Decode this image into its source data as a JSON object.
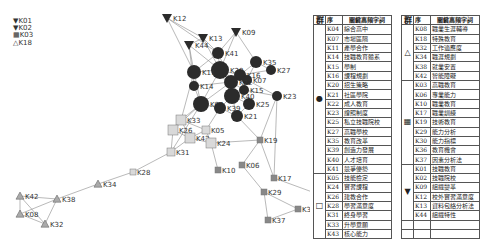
{
  "legend": [
    {
      "symbol": "▼",
      "code": "K01"
    },
    {
      "symbol": "▼",
      "code": "K02"
    },
    {
      "symbol": "▦",
      "code": "K03"
    },
    {
      "symbol": "△",
      "code": "K18"
    }
  ],
  "table": {
    "headers": {
      "group": "群",
      "code": "序",
      "keyword": "關鍵高頻字詞"
    },
    "left": {
      "groups": [
        {
          "symbol": "●",
          "rows": [
            {
              "code": "K04",
              "keyword": "綜合高中"
            },
            {
              "code": "K07",
              "keyword": "市場區隔"
            },
            {
              "code": "K11",
              "keyword": "產學合作"
            },
            {
              "code": "K14",
              "keyword": "技職教育體系"
            },
            {
              "code": "K15",
              "keyword": "學制"
            },
            {
              "code": "K16",
              "keyword": "課程規劃"
            },
            {
              "code": "K20",
              "keyword": "招生策略"
            },
            {
              "code": "K21",
              "keyword": "社區學院"
            },
            {
              "code": "K22",
              "keyword": "成人教育"
            },
            {
              "code": "K23",
              "keyword": "證照制度"
            },
            {
              "code": "K25",
              "keyword": "私立技職院校"
            },
            {
              "code": "K27",
              "keyword": "高職學校"
            },
            {
              "code": "K35",
              "keyword": "教育改革"
            },
            {
              "code": "K39",
              "keyword": "創造力發展"
            },
            {
              "code": "K40",
              "keyword": "人才培育"
            },
            {
              "code": "K41",
              "keyword": "競爭優勢"
            }
          ]
        },
        {
          "symbol": "□",
          "rows": [
            {
              "code": "K05",
              "keyword": "技能檢定"
            },
            {
              "code": "K24",
              "keyword": "實習課程"
            },
            {
              "code": "K26",
              "keyword": "建教合作"
            },
            {
              "code": "K28",
              "keyword": "學習滿意度"
            },
            {
              "code": "K31",
              "keyword": "終身學習"
            },
            {
              "code": "K33",
              "keyword": "升學意願"
            },
            {
              "code": "K43",
              "keyword": "核心能力"
            }
          ]
        }
      ]
    },
    "right": {
      "groups": [
        {
          "symbol": "△",
          "rows": [
            {
              "code": "K08",
              "keyword": "職業生涯輔導"
            },
            {
              "code": "K18",
              "keyword": "特殊教育"
            },
            {
              "code": "K32",
              "keyword": "工作適應度"
            },
            {
              "code": "K34",
              "keyword": "職涯規劃"
            },
            {
              "code": "K38",
              "keyword": "就業安置"
            },
            {
              "code": "K42",
              "keyword": "智能障礙"
            }
          ]
        },
        {
          "symbol": "▦",
          "rows": [
            {
              "code": "K03",
              "keyword": "高職教育"
            },
            {
              "code": "K06",
              "keyword": "專業能力"
            },
            {
              "code": "K10",
              "keyword": "職業教育"
            },
            {
              "code": "K17",
              "keyword": "職業訓練"
            },
            {
              "code": "K19",
              "keyword": "技術教育"
            },
            {
              "code": "K29",
              "keyword": "能力分析"
            },
            {
              "code": "K30",
              "keyword": "能力指標"
            },
            {
              "code": "K36",
              "keyword": "教育機會"
            },
            {
              "code": "K37",
              "keyword": "因素分析法"
            }
          ]
        },
        {
          "symbol": "▼",
          "rows": [
            {
              "code": "K01",
              "keyword": "技職教育"
            },
            {
              "code": "K02",
              "keyword": "技職院校"
            },
            {
              "code": "K09",
              "keyword": "組織變革"
            },
            {
              "code": "K12",
              "keyword": "校外實習滿意度"
            },
            {
              "code": "K13",
              "keyword": "資料包絡分析法"
            },
            {
              "code": "K44",
              "keyword": "組織特性"
            }
          ]
        }
      ]
    }
  },
  "network": {
    "nodes": [
      {
        "id": "K12",
        "shape": "tri-down",
        "x": 167,
        "y": 18,
        "r": 5
      },
      {
        "id": "K13",
        "shape": "tri-down",
        "x": 203,
        "y": 38,
        "r": 5
      },
      {
        "id": "K09",
        "shape": "tri-down",
        "x": 236,
        "y": 32,
        "r": 5
      },
      {
        "id": "K44",
        "shape": "tri-down",
        "x": 189,
        "y": 45,
        "r": 5
      },
      {
        "id": "K41",
        "shape": "circle",
        "x": 218,
        "y": 53,
        "r": 6
      },
      {
        "id": "K20",
        "shape": "circle",
        "x": 220,
        "y": 70,
        "r": 9
      },
      {
        "id": "K35",
        "shape": "circle",
        "x": 256,
        "y": 62,
        "r": 6
      },
      {
        "id": "K27",
        "shape": "circle",
        "x": 271,
        "y": 70,
        "r": 5
      },
      {
        "id": "K11",
        "shape": "circle",
        "x": 194,
        "y": 72,
        "r": 7
      },
      {
        "id": "K16",
        "shape": "circle",
        "x": 240,
        "y": 75,
        "r": 6
      },
      {
        "id": "K07",
        "shape": "circle",
        "x": 247,
        "y": 80,
        "r": 5
      },
      {
        "id": "K22",
        "shape": "circle",
        "x": 231,
        "y": 82,
        "r": 7
      },
      {
        "id": "K14",
        "shape": "circle",
        "x": 194,
        "y": 86,
        "r": 5
      },
      {
        "id": "K40",
        "shape": "circle",
        "x": 232,
        "y": 96,
        "r": 8
      },
      {
        "id": "K15",
        "shape": "circle",
        "x": 244,
        "y": 90,
        "r": 5
      },
      {
        "id": "K23",
        "shape": "circle",
        "x": 277,
        "y": 96,
        "r": 5
      },
      {
        "id": "K04",
        "shape": "circle",
        "x": 201,
        "y": 104,
        "r": 8
      },
      {
        "id": "K25",
        "shape": "circle",
        "x": 249,
        "y": 104,
        "r": 6
      },
      {
        "id": "K39",
        "shape": "circle",
        "x": 220,
        "y": 108,
        "r": 6
      },
      {
        "id": "K21",
        "shape": "circle",
        "x": 237,
        "y": 116,
        "r": 6
      },
      {
        "id": "K33",
        "shape": "square",
        "x": 181,
        "y": 120,
        "r": 5
      },
      {
        "id": "K26",
        "shape": "square",
        "x": 173,
        "y": 130,
        "r": 5
      },
      {
        "id": "K05",
        "shape": "square",
        "x": 206,
        "y": 130,
        "r": 4
      },
      {
        "id": "K43",
        "shape": "square",
        "x": 190,
        "y": 138,
        "r": 5
      },
      {
        "id": "K24",
        "shape": "square",
        "x": 211,
        "y": 143,
        "r": 5
      },
      {
        "id": "K31",
        "shape": "square",
        "x": 171,
        "y": 152,
        "r": 4
      },
      {
        "id": "K28",
        "shape": "square",
        "x": 133,
        "y": 172,
        "r": 3
      },
      {
        "id": "K19",
        "shape": "grid",
        "x": 260,
        "y": 140,
        "r": 3
      },
      {
        "id": "K06",
        "shape": "grid",
        "x": 242,
        "y": 165,
        "r": 3
      },
      {
        "id": "K10",
        "shape": "grid",
        "x": 218,
        "y": 170,
        "r": 3
      },
      {
        "id": "K17",
        "shape": "grid",
        "x": 274,
        "y": 178,
        "r": 3
      },
      {
        "id": "K29",
        "shape": "grid",
        "x": 264,
        "y": 192,
        "r": 3
      },
      {
        "id": "K36",
        "shape": "grid",
        "x": 315,
        "y": 193,
        "r": 3
      },
      {
        "id": "K30",
        "shape": "grid",
        "x": 298,
        "y": 209,
        "r": 3
      },
      {
        "id": "K37",
        "shape": "grid",
        "x": 268,
        "y": 220,
        "r": 3
      },
      {
        "id": "K34",
        "shape": "tri-up",
        "x": 98,
        "y": 184,
        "r": 4
      },
      {
        "id": "K42",
        "shape": "tri-up",
        "x": 20,
        "y": 196,
        "r": 4
      },
      {
        "id": "K38",
        "shape": "tri-up",
        "x": 57,
        "y": 199,
        "r": 4
      },
      {
        "id": "K08",
        "shape": "tri-up",
        "x": 20,
        "y": 214,
        "r": 4
      },
      {
        "id": "K32",
        "shape": "tri-up",
        "x": 45,
        "y": 224,
        "r": 4
      }
    ],
    "edges": [
      [
        "K12",
        "K13"
      ],
      [
        "K12",
        "K41"
      ],
      [
        "K12",
        "K11"
      ],
      [
        "K13",
        "K41"
      ],
      [
        "K13",
        "K20"
      ],
      [
        "K13",
        "K44"
      ],
      [
        "K09",
        "K41"
      ],
      [
        "K09",
        "K35"
      ],
      [
        "K09",
        "K20"
      ],
      [
        "K44",
        "K11"
      ],
      [
        "K44",
        "K20"
      ],
      [
        "K44",
        "K14"
      ],
      [
        "K41",
        "K20"
      ],
      [
        "K41",
        "K11"
      ],
      [
        "K41",
        "K22"
      ],
      [
        "K20",
        "K16"
      ],
      [
        "K20",
        "K22"
      ],
      [
        "K20",
        "K11"
      ],
      [
        "K20",
        "K40"
      ],
      [
        "K20",
        "K04"
      ],
      [
        "K35",
        "K16"
      ],
      [
        "K35",
        "K27"
      ],
      [
        "K35",
        "K07"
      ],
      [
        "K16",
        "K27"
      ],
      [
        "K16",
        "K07"
      ],
      [
        "K22",
        "K40"
      ],
      [
        "K22",
        "K14"
      ],
      [
        "K22",
        "K04"
      ],
      [
        "K22",
        "K15"
      ],
      [
        "K11",
        "K14"
      ],
      [
        "K11",
        "K04"
      ],
      [
        "K14",
        "K04"
      ],
      [
        "K40",
        "K39"
      ],
      [
        "K40",
        "K25"
      ],
      [
        "K40",
        "K21"
      ],
      [
        "K40",
        "K15"
      ],
      [
        "K15",
        "K23"
      ],
      [
        "K07",
        "K23"
      ],
      [
        "K04",
        "K39"
      ],
      [
        "K04",
        "K33"
      ],
      [
        "K04",
        "K26"
      ],
      [
        "K39",
        "K21"
      ],
      [
        "K39",
        "K05"
      ],
      [
        "K25",
        "K21"
      ],
      [
        "K21",
        "K19"
      ],
      [
        "K23",
        "K19"
      ],
      [
        "K23",
        "K17"
      ],
      [
        "K33",
        "K26"
      ],
      [
        "K33",
        "K43"
      ],
      [
        "K33",
        "K05"
      ],
      [
        "K26",
        "K43"
      ],
      [
        "K26",
        "K31"
      ],
      [
        "K43",
        "K24"
      ],
      [
        "K43",
        "K05"
      ],
      [
        "K43",
        "K31"
      ],
      [
        "K05",
        "K24"
      ],
      [
        "K24",
        "K19"
      ],
      [
        "K24",
        "K10"
      ],
      [
        "K31",
        "K28"
      ],
      [
        "K19",
        "K06"
      ],
      [
        "K19",
        "K17"
      ],
      [
        "K06",
        "K29"
      ],
      [
        "K17",
        "K36"
      ],
      [
        "K29",
        "K30"
      ],
      [
        "K29",
        "K37"
      ],
      [
        "K37",
        "K30"
      ],
      [
        "K28",
        "K34"
      ],
      [
        "K34",
        "K38"
      ],
      [
        "K38",
        "K42"
      ],
      [
        "K38",
        "K08"
      ],
      [
        "K38",
        "K32"
      ],
      [
        "K42",
        "K08"
      ],
      [
        "K42",
        "K32"
      ],
      [
        "K08",
        "K32"
      ],
      [
        "K04",
        "K31"
      ],
      [
        "K11",
        "K33"
      ]
    ]
  },
  "colors": {
    "node_dark": "#2b2b2b",
    "node_square": "#d9d9d9",
    "edge": "#8a8a8a",
    "grid_fill": "#888888",
    "tri_fill": "#aaaaaa"
  }
}
